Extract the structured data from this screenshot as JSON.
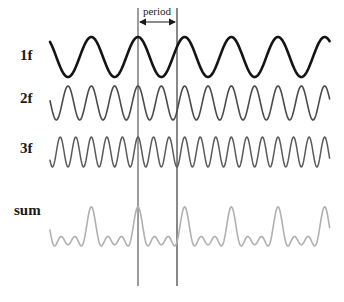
{
  "figure": {
    "background_color": "#ffffff",
    "annotation": {
      "period_label": "period",
      "marker_line_color": "#3a3a3a",
      "arrow_color": "#1a1a1a"
    },
    "rows": [
      {
        "label": "1f",
        "harmonic": 1,
        "color": "#141414",
        "stroke_width": 2.6,
        "baseline_y": 57,
        "amplitude": 20
      },
      {
        "label": "2f",
        "harmonic": 2,
        "color": "#4a4a4a",
        "stroke_width": 1.6,
        "baseline_y": 103,
        "amplitude": 17
      },
      {
        "label": "3f",
        "harmonic": 3,
        "color": "#5a5a5a",
        "stroke_width": 1.5,
        "baseline_y": 152,
        "amplitude": 15
      },
      {
        "label": "sum",
        "harmonic": 0,
        "color": "#b0b0b0",
        "stroke_width": 1.6,
        "baseline_y": 235,
        "amplitude": 13
      }
    ]
  },
  "chart_data": {
    "type": "line",
    "xlabel": "",
    "ylabel": "",
    "grid": false,
    "legend_position": "left",
    "annotations": [
      {
        "text": "period",
        "type": "span-arrow",
        "x_start_px": 138,
        "x_end_px": 177,
        "description": "double-headed arrow spanning one period of the 1f wave between two vertical marker lines"
      }
    ],
    "x_domain_px": [
      50,
      330
    ],
    "cycles_of_fundamental_across_plot": 6,
    "series": [
      {
        "name": "1f",
        "waveform": "sine",
        "frequency_multiple": 1,
        "amplitude": 1.0,
        "phase_deg": 90,
        "color": "#141414"
      },
      {
        "name": "2f",
        "waveform": "sine",
        "frequency_multiple": 2,
        "amplitude": 0.85,
        "phase_deg": 90,
        "color": "#4a4a4a"
      },
      {
        "name": "3f",
        "waveform": "sine",
        "frequency_multiple": 3,
        "amplitude": 0.75,
        "phase_deg": 90,
        "color": "#5a5a5a"
      },
      {
        "name": "sum",
        "waveform": "sum of 1f + 2f + 3f",
        "frequency_multiple": 1,
        "amplitude": 2.6,
        "phase_deg": 90,
        "color": "#b0b0b0"
      }
    ],
    "tick_labels": [
      "1f",
      "2f",
      "3f",
      "sum"
    ]
  }
}
